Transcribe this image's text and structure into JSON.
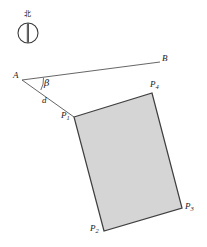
{
  "figure": {
    "type": "geometry-diagram",
    "background_color": "#ffffff",
    "stroke_color": "#404040",
    "fill_color": "#d5d5d5",
    "compass": {
      "north_label": "北",
      "icon_name": "compass-north-icon",
      "center_x": 28,
      "center_y": 33,
      "radius": 10
    },
    "points": [
      {
        "id": "A",
        "label": "A",
        "sub": "",
        "x": 22,
        "y": 80,
        "label_x": 13,
        "label_y": 71
      },
      {
        "id": "B",
        "label": "B",
        "sub": "",
        "x": 160,
        "y": 62,
        "label_x": 162,
        "label_y": 54
      },
      {
        "id": "P1",
        "label": "P",
        "sub": "1",
        "x": 74,
        "y": 117,
        "label_x": 61,
        "label_y": 111
      },
      {
        "id": "P2",
        "label": "P",
        "sub": "2",
        "x": 104,
        "y": 231,
        "label_x": 90,
        "label_y": 224
      },
      {
        "id": "P3",
        "label": "P",
        "sub": "3",
        "x": 182,
        "y": 208,
        "label_x": 185,
        "label_y": 202
      },
      {
        "id": "P4",
        "label": "P",
        "sub": "4",
        "x": 152,
        "y": 93,
        "label_x": 150,
        "label_y": 80
      }
    ],
    "segments": [
      {
        "name": "segment-A-B",
        "from": "A",
        "to": "B"
      },
      {
        "name": "segment-A-P1",
        "from": "A",
        "to": "P1"
      }
    ],
    "rectangle": {
      "name": "shaded-rectangle",
      "vertices": [
        "P1",
        "P4",
        "P3",
        "P2"
      ],
      "points_attr": "74,117 152,93 182,208 104,231"
    },
    "annotations": {
      "angle_beta": {
        "label": "β",
        "x": 44,
        "y": 78
      },
      "distance_d": {
        "label": "d",
        "x": 42,
        "y": 96
      }
    },
    "angle_arc": {
      "name": "angle-beta-arc",
      "path": "M 43.5 77.8 A 22 22 0 0 1 40.8 90.0"
    }
  }
}
